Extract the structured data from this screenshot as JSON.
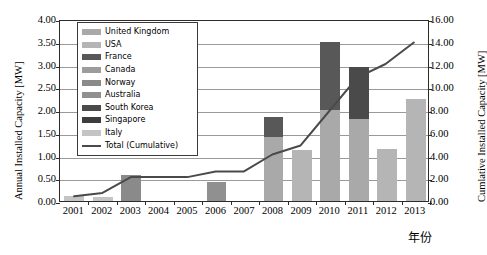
{
  "chart_data": {
    "type": "bar",
    "title": "",
    "subtitle": "",
    "xlabel": "年份",
    "ylabel": "Annual Installed Capacity [MW]",
    "y2label": "Cumlative Installed Capacity [MW]",
    "categories": [
      "2001",
      "2002",
      "2003",
      "2004",
      "2005",
      "2006",
      "2007",
      "2008",
      "2009",
      "2010",
      "2011",
      "2012",
      "2013"
    ],
    "ylim": [
      0,
      4.0
    ],
    "yticks": [
      "0.00",
      "0.50",
      "1.00",
      "1.50",
      "2.00",
      "2.50",
      "3.00",
      "3.50",
      "4.00"
    ],
    "ytick_values": [
      0.0,
      0.5,
      1.0,
      1.5,
      2.0,
      2.5,
      3.0,
      3.5,
      4.0
    ],
    "y2lim": [
      0,
      16.0
    ],
    "y2ticks": [
      "0.00",
      "2.00",
      "4.00",
      "6.00",
      "8.00",
      "10.00",
      "12.00",
      "14.00",
      "16.00"
    ],
    "y2tick_values": [
      0,
      2,
      4,
      6,
      8,
      10,
      12,
      14,
      16
    ],
    "grid": true,
    "stacked": true,
    "legend_position": "upper-left-inside",
    "series": [
      {
        "name": "United Kingdom",
        "color": "#a9a9a9",
        "values": [
          0.0,
          0.0,
          0.0,
          0.0,
          0.0,
          0.0,
          0.0,
          1.4,
          0.0,
          2.0,
          1.8,
          0.0,
          0.0
        ]
      },
      {
        "name": "USA",
        "color": "#b5b5b5",
        "values": [
          0.0,
          0.0,
          0.0,
          0.0,
          0.0,
          0.0,
          0.0,
          0.0,
          1.12,
          0.0,
          0.0,
          1.15,
          2.25
        ]
      },
      {
        "name": "France",
        "color": "#585858",
        "values": [
          0.0,
          0.0,
          0.0,
          0.0,
          0.0,
          0.0,
          0.0,
          0.45,
          0.0,
          1.5,
          0.0,
          0.0,
          0.0
        ]
      },
      {
        "name": "Canada",
        "color": "#9c9c9c",
        "values": [
          0.0,
          0.0,
          0.0,
          0.0,
          0.0,
          0.0,
          0.0,
          0.0,
          0.0,
          0.0,
          0.0,
          0.0,
          0.0
        ]
      },
      {
        "name": "Norway",
        "color": "#8a8a8a",
        "values": [
          0.0,
          0.0,
          0.57,
          0.0,
          0.0,
          0.0,
          0.0,
          0.0,
          0.0,
          0.0,
          0.0,
          0.0,
          0.0
        ]
      },
      {
        "name": "Australia",
        "color": "#909090",
        "values": [
          0.0,
          0.0,
          0.0,
          0.0,
          0.0,
          0.42,
          0.0,
          0.0,
          0.0,
          0.0,
          0.0,
          0.0,
          0.0
        ]
      },
      {
        "name": "South Korea",
        "color": "#4a4a4a",
        "values": [
          0.0,
          0.0,
          0.0,
          0.0,
          0.0,
          0.0,
          0.0,
          0.0,
          0.0,
          0.0,
          1.15,
          0.0,
          0.0
        ]
      },
      {
        "name": "Singapore",
        "color": "#3d3d3d",
        "values": [
          0.0,
          0.0,
          0.0,
          0.0,
          0.0,
          0.0,
          0.0,
          0.0,
          0.0,
          0.0,
          0.0,
          0.0,
          0.0
        ]
      },
      {
        "name": "Italy",
        "color": "#c4c4c4",
        "values": [
          0.12,
          0.08,
          0.0,
          0.0,
          0.0,
          0.0,
          0.0,
          0.0,
          0.0,
          0.0,
          0.0,
          0.0,
          0.0
        ]
      }
    ],
    "line_series": {
      "name": "Total (Cumulative)",
      "color": "#4a4a4a",
      "axis": "right",
      "values": [
        0.5,
        0.8,
        2.2,
        2.2,
        2.2,
        2.7,
        2.7,
        4.2,
        5.0,
        8.0,
        11.0,
        12.2,
        14.1
      ]
    }
  },
  "legend": {
    "entries": [
      {
        "label": "United Kingdom"
      },
      {
        "label": "USA"
      },
      {
        "label": "France"
      },
      {
        "label": "Canada"
      },
      {
        "label": "Norway"
      },
      {
        "label": "Australia"
      },
      {
        "label": "South Korea"
      },
      {
        "label": "Singapore"
      },
      {
        "label": "Italy"
      },
      {
        "label": "Total (Cumulative)"
      }
    ]
  }
}
